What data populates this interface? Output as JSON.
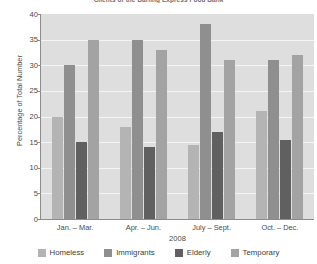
{
  "chart_data": {
    "type": "bar",
    "title": "Clients of the Darling Express Food Bank",
    "xlabel": "2008",
    "ylabel": "Percentage of Total Number",
    "ylim": [
      0,
      40
    ],
    "yticks": [
      0,
      5,
      10,
      15,
      20,
      25,
      30,
      35,
      40
    ],
    "grid": true,
    "legend_position": "bottom",
    "categories": [
      "Jan. – Mar.",
      "Apr. – Jun.",
      "July – Sept.",
      "Oct. – Dec."
    ],
    "series": [
      {
        "name": "Homeless",
        "color": "#b4b4b4",
        "values": [
          20,
          18,
          14.5,
          21
        ]
      },
      {
        "name": "Immigrants",
        "color": "#8f8f8f",
        "values": [
          30,
          35,
          38,
          31
        ]
      },
      {
        "name": "Elderly",
        "color": "#606060",
        "values": [
          15,
          14,
          17,
          15.5
        ]
      },
      {
        "name": "Temporary",
        "color": "#a3a3a3",
        "values": [
          35,
          33,
          31,
          32
        ]
      }
    ]
  },
  "axes": {
    "plot_background": "#dedede",
    "gridline_color": "#f4f4f4",
    "axis_color": "#8c8c8c"
  }
}
